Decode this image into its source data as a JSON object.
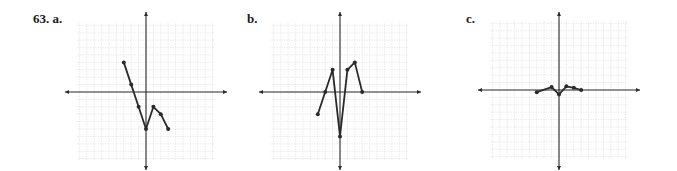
{
  "labels": {
    "problem": "63. a.",
    "b": "b.",
    "c": "c."
  },
  "colors": {
    "grid": "#e2e2e2",
    "axis": "#2a2a2a",
    "curve": "#2a2a2a",
    "text": "#1a1a1a"
  },
  "chart_data": [
    {
      "type": "line",
      "title": "63. a.",
      "grid": true,
      "xlim": [
        -10,
        10
      ],
      "ylim": [
        -10,
        10
      ],
      "x": [
        -3,
        -2,
        -1,
        0,
        1,
        2,
        3
      ],
      "y": [
        4,
        1,
        -2,
        -5,
        -2,
        -3,
        -5
      ],
      "origin_px": [
        146,
        92
      ],
      "unit_px": 7.4
    },
    {
      "type": "line",
      "title": "b.",
      "grid": true,
      "xlim": [
        -10,
        10
      ],
      "ylim": [
        -10,
        10
      ],
      "x": [
        -3,
        -2,
        -1,
        0,
        1,
        2,
        3
      ],
      "y": [
        -3,
        0,
        3,
        -6,
        3,
        4,
        0
      ],
      "origin_px": [
        340,
        92
      ],
      "unit_px": 7.4
    },
    {
      "type": "line",
      "title": "c.",
      "grid": true,
      "xlim": [
        -10,
        10
      ],
      "ylim": [
        -10,
        10
      ],
      "x": [
        -3,
        -1,
        0,
        1,
        2,
        3
      ],
      "y": [
        -0.3,
        0.4,
        -0.6,
        0.5,
        0.3,
        0
      ],
      "origin_px": [
        559,
        90
      ],
      "unit_px": 7.4
    }
  ]
}
